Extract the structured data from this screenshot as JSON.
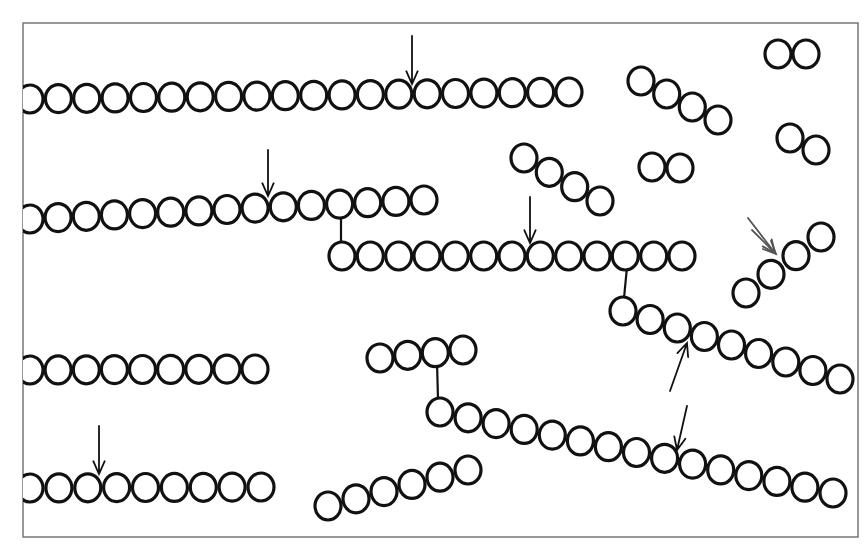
{
  "diagram": {
    "frame": {
      "x": 23,
      "y": 23,
      "width": 835,
      "height": 514
    },
    "colors": {
      "stroke": "#111111",
      "frame": "#777777",
      "background": "#ffffff"
    },
    "bead_radius": 13,
    "chains": [
      {
        "id": "chain-top-long",
        "start": [
          30,
          99
        ],
        "end": [
          569,
          92
        ],
        "count": 20
      },
      {
        "id": "chain-second",
        "start": [
          30,
          219
        ],
        "end": [
          424,
          200
        ],
        "count": 15
      },
      {
        "id": "chain-third",
        "start": [
          342,
          256
        ],
        "end": [
          682,
          256
        ],
        "count": 13
      },
      {
        "id": "chain-diag-right",
        "start": [
          623,
          311
        ],
        "end": [
          840,
          379
        ],
        "count": 9
      },
      {
        "id": "chain-mid-left",
        "start": [
          30,
          370
        ],
        "end": [
          255,
          369
        ],
        "count": 9
      },
      {
        "id": "chain-bottom-left",
        "start": [
          30,
          488
        ],
        "end": [
          261,
          487
        ],
        "count": 9
      },
      {
        "id": "chain-small-four",
        "start": [
          380,
          358
        ],
        "end": [
          463,
          350
        ],
        "count": 4
      },
      {
        "id": "chain-long-diag",
        "start": [
          440,
          412
        ],
        "end": [
          833,
          493
        ],
        "count": 15
      },
      {
        "id": "chain-bottom-six",
        "start": [
          328,
          506
        ],
        "end": [
          468,
          470
        ],
        "count": 6
      },
      {
        "id": "chain-four-a",
        "start": [
          641,
          81
        ],
        "end": [
          718,
          120
        ],
        "count": 4
      },
      {
        "id": "chain-four-b",
        "start": [
          524,
          158
        ],
        "end": [
          600,
          201
        ],
        "count": 4
      },
      {
        "id": "pair-top-right",
        "start": [
          778,
          54
        ],
        "end": [
          806,
          54
        ],
        "count": 2
      },
      {
        "id": "pair-right",
        "start": [
          790,
          138
        ],
        "end": [
          816,
          150
        ],
        "count": 2
      },
      {
        "id": "pair-middle",
        "start": [
          652,
          167
        ],
        "end": [
          680,
          168
        ],
        "count": 2
      },
      {
        "id": "chain-four-rising",
        "start": [
          746,
          293
        ],
        "end": [
          821,
          237
        ],
        "count": 4
      }
    ],
    "branch_links": [
      {
        "from": [
          341,
          212
        ],
        "to": [
          341,
          243
        ]
      },
      {
        "from": [
          627,
          267
        ],
        "to": [
          624,
          298
        ]
      },
      {
        "from": [
          437,
          362
        ],
        "to": [
          438,
          399
        ]
      }
    ],
    "arrows": [
      {
        "id": "arrow-top-chain",
        "from": [
          412,
          36
        ],
        "to": [
          412,
          84
        ],
        "tone": "dark"
      },
      {
        "id": "arrow-second-chain",
        "from": [
          268,
          150
        ],
        "to": [
          268,
          196
        ],
        "tone": "dark"
      },
      {
        "id": "arrow-third-chain",
        "from": [
          530,
          197
        ],
        "to": [
          530,
          243
        ],
        "tone": "dark"
      },
      {
        "id": "arrow-diag-up",
        "from": [
          670,
          391
        ],
        "to": [
          687,
          343
        ],
        "tone": "dark"
      },
      {
        "id": "arrow-long-diag",
        "from": [
          687,
          406
        ],
        "to": [
          677,
          450
        ],
        "tone": "dark"
      },
      {
        "id": "arrow-bottom-left",
        "from": [
          99,
          426
        ],
        "to": [
          99,
          474
        ],
        "tone": "dark"
      },
      {
        "id": "arrow-double-right-1",
        "from": [
          748,
          218
        ],
        "to": [
          775,
          253
        ],
        "tone": "gray"
      },
      {
        "id": "arrow-double-right-2",
        "from": [
          752,
          230
        ],
        "to": [
          776,
          254
        ],
        "tone": "gray"
      }
    ]
  }
}
